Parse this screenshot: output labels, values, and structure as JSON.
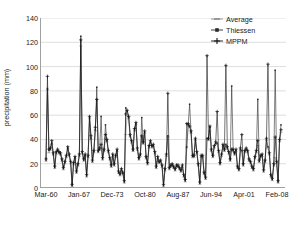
{
  "chart_data": {
    "type": "line",
    "title": "",
    "xlabel": "",
    "ylabel": "precipitation (mm)",
    "ylim": [
      0,
      140
    ],
    "yticks": [
      0,
      20,
      40,
      60,
      80,
      100,
      120,
      140
    ],
    "xtick_labels": [
      "Mar-60",
      "Jan-67",
      "Dec-73",
      "Oct-80",
      "Aug-87",
      "Jun-94",
      "Apr-01",
      "Feb-08"
    ],
    "xlim_labels": [
      "Mar-60",
      "Feb-08"
    ],
    "grid": "horizontal",
    "legend_position": "top-right",
    "colors": {
      "average": "#8c8c8c",
      "thiessen": "#2b2b2b",
      "mppm": "#111111",
      "gridline": "#cfcfcf",
      "axis": "#a0a0a0",
      "text": "#1a1a1a",
      "background": "#ffffff"
    },
    "series": [
      {
        "name": "Average",
        "marker": "dash",
        "values": [
          22,
          81,
          29,
          31,
          36,
          27,
          16,
          28,
          30,
          28,
          27,
          22,
          15,
          20,
          25,
          32,
          26,
          20,
          1,
          19,
          24,
          12,
          18,
          26,
          117,
          28,
          22,
          26,
          9,
          25,
          57,
          40,
          21,
          29,
          47,
          73,
          29,
          31,
          33,
          23,
          30,
          41,
          38,
          29,
          23,
          17,
          26,
          18,
          25,
          30,
          12,
          10,
          14,
          11,
          4,
          44,
          60,
          57,
          42,
          37,
          30,
          47,
          52,
          31,
          23,
          26,
          42,
          36,
          45,
          24,
          19,
          33,
          37,
          33,
          34,
          28,
          16,
          24,
          20,
          21,
          17,
          1,
          14,
          26,
          42,
          15,
          17,
          18,
          16,
          14,
          17,
          17,
          15,
          13,
          17,
          9,
          5,
          33,
          51,
          50,
          45,
          25,
          25,
          39,
          28,
          18,
          3,
          25,
          25,
          11,
          7,
          40,
          39,
          47,
          30,
          25,
          33,
          36,
          36,
          29,
          19,
          26,
          34,
          30,
          35,
          32,
          28,
          22,
          31,
          30,
          27,
          30,
          16,
          14,
          31,
          30,
          18,
          29,
          31,
          29,
          22,
          20,
          16,
          14,
          24,
          29,
          35,
          21,
          25,
          26,
          13,
          21,
          39,
          33,
          27,
          9,
          6,
          18,
          25,
          20,
          4,
          38,
          46
        ]
      },
      {
        "name": "Thiessen",
        "marker": "square",
        "values": [
          23,
          82,
          31,
          32,
          37,
          28,
          17,
          29,
          31,
          29,
          28,
          23,
          16,
          21,
          26,
          33,
          27,
          21,
          2,
          20,
          25,
          13,
          19,
          27,
          125,
          29,
          23,
          27,
          10,
          26,
          58,
          41,
          22,
          30,
          48,
          83,
          30,
          32,
          59,
          24,
          31,
          52,
          39,
          30,
          24,
          18,
          27,
          19,
          26,
          31,
          13,
          11,
          15,
          12,
          5,
          66,
          63,
          58,
          43,
          38,
          31,
          48,
          53,
          32,
          24,
          27,
          58,
          37,
          46,
          25,
          20,
          34,
          38,
          34,
          35,
          29,
          17,
          25,
          21,
          22,
          18,
          2,
          15,
          27,
          43,
          16,
          18,
          19,
          17,
          15,
          18,
          18,
          16,
          14,
          18,
          10,
          6,
          34,
          52,
          69,
          46,
          26,
          26,
          40,
          29,
          19,
          4,
          26,
          26,
          12,
          8,
          41,
          40,
          50,
          31,
          26,
          34,
          37,
          37,
          30,
          20,
          27,
          35,
          31,
          36,
          33,
          29,
          23,
          84,
          31,
          28,
          31,
          17,
          15,
          32,
          31,
          19,
          30,
          32,
          30,
          23,
          21,
          17,
          15,
          25,
          30,
          73,
          22,
          26,
          27,
          14,
          22,
          40,
          34,
          28,
          10,
          7,
          19,
          97,
          21,
          5,
          39,
          52
        ]
      },
      {
        "name": "MPPM",
        "marker": "plus",
        "values": [
          24,
          92,
          32,
          33,
          39,
          29,
          18,
          30,
          32,
          30,
          29,
          24,
          17,
          22,
          27,
          34,
          28,
          22,
          3,
          21,
          26,
          14,
          20,
          28,
          122,
          30,
          24,
          28,
          11,
          27,
          59,
          43,
          23,
          31,
          50,
          73,
          31,
          33,
          36,
          25,
          32,
          44,
          40,
          31,
          25,
          19,
          28,
          20,
          27,
          32,
          14,
          12,
          16,
          13,
          6,
          61,
          64,
          59,
          44,
          39,
          32,
          49,
          54,
          33,
          25,
          28,
          43,
          38,
          47,
          26,
          21,
          35,
          39,
          35,
          36,
          30,
          18,
          26,
          22,
          23,
          19,
          3,
          16,
          28,
          78,
          17,
          19,
          20,
          18,
          16,
          19,
          19,
          17,
          15,
          19,
          11,
          7,
          53,
          53,
          51,
          47,
          27,
          27,
          41,
          30,
          20,
          5,
          27,
          27,
          13,
          9,
          109,
          41,
          51,
          32,
          27,
          35,
          38,
          63,
          31,
          21,
          28,
          36,
          32,
          101,
          34,
          30,
          24,
          32,
          32,
          29,
          32,
          18,
          16,
          33,
          44,
          20,
          31,
          33,
          31,
          24,
          22,
          18,
          16,
          26,
          31,
          39,
          23,
          27,
          28,
          15,
          23,
          41,
          102,
          29,
          11,
          8,
          20,
          42,
          22,
          6,
          40,
          48
        ]
      }
    ]
  }
}
